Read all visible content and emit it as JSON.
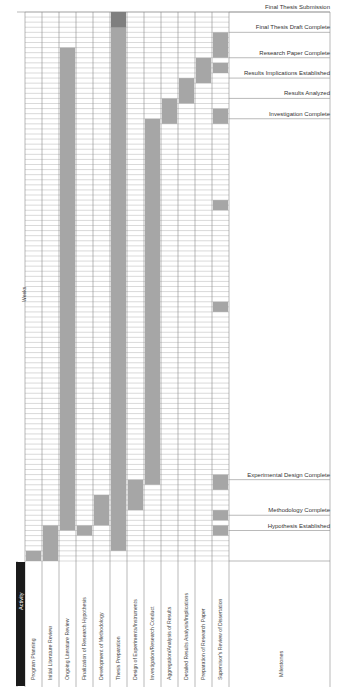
{
  "chart_data": {
    "type": "gantt",
    "orientation": "rotated-90",
    "title": "",
    "axis_label": "Weeks",
    "header_label": "Activity",
    "milestones_header": "Milestones",
    "total_weeks": 108,
    "activities": [
      {
        "name": "Program Planning",
        "start": 1,
        "end": 2
      },
      {
        "name": "Initial Literature Review",
        "start": 1,
        "end": 7
      },
      {
        "name": "Ongoing Literature Review",
        "start": 7,
        "end": 101
      },
      {
        "name": "Finalization of Research Hypothesis",
        "start": 6,
        "end": 7
      },
      {
        "name": "Development of Methodology",
        "start": 8,
        "end": 13
      },
      {
        "name": "Thesis Preparation",
        "start": 3,
        "end": 108
      },
      {
        "name": "Design of Experiments/Instruments",
        "start": 11,
        "end": 16
      },
      {
        "name": "Investigation/Research Conduct",
        "start": 16,
        "end": 87
      },
      {
        "name": "Aggregation/Analysis of Results",
        "start": 87,
        "end": 91
      },
      {
        "name": "Detailed Results Analysis/Implications",
        "start": 91,
        "end": 95
      },
      {
        "name": "Preparation of Research Paper",
        "start": 95,
        "end": 99
      },
      {
        "name": "Supervisor's Review of Dissertation",
        "segments": [
          [
            6,
            7
          ],
          [
            9,
            10
          ],
          [
            15,
            17
          ],
          [
            50,
            51
          ],
          [
            70,
            71
          ],
          [
            97,
            98
          ],
          [
            87,
            89
          ],
          [
            100,
            104
          ]
        ]
      }
    ],
    "milestones": [
      {
        "label": "Final Thesis Submission",
        "week": 108
      },
      {
        "label": "Final Thesis Draft Complete",
        "week": 104
      },
      {
        "label": "Research Paper Complete",
        "week": 99
      },
      {
        "label": "Results Implications Established",
        "week": 95
      },
      {
        "label": "Results Analyzed",
        "week": 91
      },
      {
        "label": "Investigation Complete",
        "week": 87
      },
      {
        "label": "Experimental Design Complete",
        "week": 16
      },
      {
        "label": "Methodology Complete",
        "week": 9
      },
      {
        "label": "Hypothesis Established",
        "week": 6
      }
    ],
    "colors": {
      "bar": "#a6a6a6",
      "bar_dark": "#7f7f7f",
      "header": "#1a1a1a",
      "grid": "#999999"
    }
  }
}
